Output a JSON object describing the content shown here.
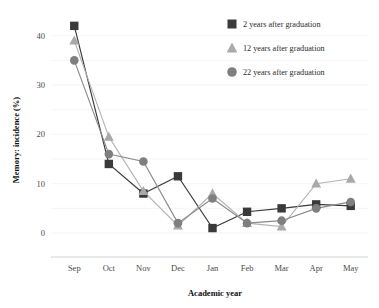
{
  "chart_data": {
    "type": "line",
    "title": "",
    "xlabel": "Academic year",
    "ylabel": "Memory: incidence (%)",
    "categories": [
      "Sep",
      "Oct",
      "Nov",
      "Dec",
      "Jan",
      "Feb",
      "Mar",
      "Apr",
      "May"
    ],
    "ylim": [
      0,
      44
    ],
    "yticks": [
      0,
      10,
      20,
      30,
      40
    ],
    "ytick_labels": [
      "0",
      "10",
      "20",
      "30",
      "40"
    ],
    "gridlines": [
      0,
      5,
      10,
      15,
      20,
      25,
      30,
      35,
      40
    ],
    "grid": true,
    "legend_position": "top-right",
    "series": [
      {
        "name": "2 years after graduation",
        "marker": "square",
        "color": "#3a3a3a",
        "line_color": "#3a3a3a",
        "values": [
          42,
          14,
          8,
          11.5,
          1,
          4.3,
          5,
          5.8,
          5.5
        ]
      },
      {
        "name": "12 years after graduation",
        "marker": "triangle",
        "color": "#a9a9a9",
        "line_color": "#b3b3b3",
        "values": [
          39,
          19.5,
          8.5,
          1.5,
          8,
          2,
          1.3,
          10,
          11
        ]
      },
      {
        "name": "22 years after graduation",
        "marker": "circle",
        "color": "#7f7f7f",
        "line_color": "#8a8a8a",
        "values": [
          35,
          16,
          14.5,
          2,
          7,
          2,
          2.5,
          5,
          6.3
        ]
      }
    ]
  },
  "style": {
    "grid_color": "#f2f0ee",
    "axis_color": "#c9c9c9",
    "background": "#ffffff"
  }
}
